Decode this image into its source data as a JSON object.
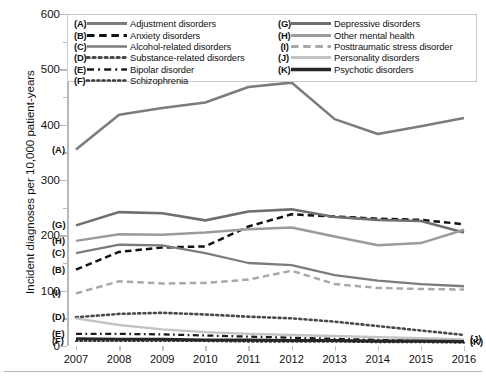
{
  "chart_data": {
    "type": "line",
    "title": "",
    "xlabel": "",
    "ylabel": "Incident diagnoses per 10,000 patient-years",
    "x": [
      2007,
      2008,
      2009,
      2010,
      2011,
      2012,
      2013,
      2014,
      2015,
      2016
    ],
    "xtick_labels": [
      "2007",
      "2008",
      "2009",
      "2010",
      "2011",
      "2012",
      "2013",
      "2014",
      "2015",
      "2016"
    ],
    "ytick_labels": [
      "0",
      "100",
      "200",
      "300",
      "400",
      "500",
      "600"
    ],
    "ylim": [
      0,
      600
    ],
    "ytick_step": 100,
    "yminor_step": 50,
    "grid": false,
    "legend_position": "top-inside",
    "series": [
      {
        "key": "A",
        "name": "Adjustment disorders",
        "style": "solid",
        "color": "#7c7c7c",
        "width": 2.6,
        "values": [
          355,
          418,
          430,
          440,
          468,
          476,
          410,
          383,
          397,
          412
        ]
      },
      {
        "key": "B",
        "name": "Anxiety disorders",
        "style": "dashed",
        "color": "#121212",
        "width": 2.5,
        "values": [
          138,
          170,
          178,
          180,
          216,
          238,
          234,
          230,
          228,
          220
        ]
      },
      {
        "key": "C",
        "name": "Alcohol-related disorders",
        "style": "solid",
        "color": "#7c7c7c",
        "width": 2.3,
        "values": [
          168,
          183,
          182,
          168,
          150,
          146,
          128,
          118,
          112,
          108
        ]
      },
      {
        "key": "D",
        "name": "Substance-related disorders",
        "style": "dotted",
        "color": "#4a4a4a",
        "width": 2.6,
        "values": [
          52,
          58,
          60,
          57,
          53,
          50,
          44,
          36,
          28,
          20
        ]
      },
      {
        "key": "E",
        "name": "Bipolar disorder",
        "style": "dashdot",
        "color": "#1c1c1c",
        "width": 2.3,
        "values": [
          22,
          22,
          21,
          19,
          17,
          15,
          13,
          11,
          9,
          8
        ]
      },
      {
        "key": "F",
        "name": "Schizophrenia",
        "style": "dotted",
        "color": "#3a3a3a",
        "width": 2.2,
        "values": [
          9,
          9,
          9,
          9,
          8,
          8,
          8,
          7,
          7,
          6
        ]
      },
      {
        "key": "G",
        "name": "Depressive disorders",
        "style": "solid",
        "color": "#6f6f6f",
        "width": 2.6,
        "values": [
          218,
          242,
          240,
          227,
          243,
          247,
          233,
          228,
          226,
          205
        ]
      },
      {
        "key": "H",
        "name": "Other mental health",
        "style": "solid",
        "color": "#9b9b9b",
        "width": 2.5,
        "values": [
          190,
          202,
          201,
          205,
          211,
          214,
          198,
          182,
          186,
          210
        ]
      },
      {
        "key": "I",
        "name": "Posttraumatic stress disorder",
        "style": "dashed",
        "color": "#a9a9a9",
        "width": 2.5,
        "values": [
          95,
          117,
          113,
          114,
          120,
          136,
          112,
          105,
          103,
          102
        ]
      },
      {
        "key": "J",
        "name": "Personality disorders",
        "style": "solid",
        "color": "#c3c3c3",
        "width": 2.4,
        "values": [
          50,
          38,
          30,
          25,
          22,
          20,
          18,
          16,
          14,
          12
        ]
      },
      {
        "key": "K",
        "name": "Psychotic disorders",
        "style": "solid",
        "color": "#262626",
        "width": 3.0,
        "values": [
          13,
          12,
          12,
          11,
          11,
          10,
          10,
          9,
          9,
          8
        ]
      }
    ]
  },
  "legend": {
    "left_column": [
      {
        "key": "(A)",
        "label": "Adjustment disorders"
      },
      {
        "key": "(B)",
        "label": "Anxiety disorders"
      },
      {
        "key": "(C)",
        "label": "Alcohol-related disorders"
      },
      {
        "key": "(D)",
        "label": "Substance-related disorders"
      },
      {
        "key": "(E)",
        "label": "Bipolar disorder"
      },
      {
        "key": "(F)",
        "label": "Schizophrenia"
      }
    ],
    "right_column": [
      {
        "key": "(G)",
        "label": "Depressive disorders"
      },
      {
        "key": "(H)",
        "label": "Other mental health"
      },
      {
        "key": "(I)",
        "label": "Posttraumatic stress disorder"
      },
      {
        "key": "(J)",
        "label": "Personality disorders"
      },
      {
        "key": "(K)",
        "label": "Psychotic disorders"
      }
    ]
  },
  "plot_labels": {
    "left": [
      "(A)",
      "(G)",
      "(H)",
      "(C)",
      "(B)",
      "(I)",
      "(D)",
      "(E)",
      "(F)"
    ],
    "right": [
      "(J)",
      "(K)"
    ]
  }
}
